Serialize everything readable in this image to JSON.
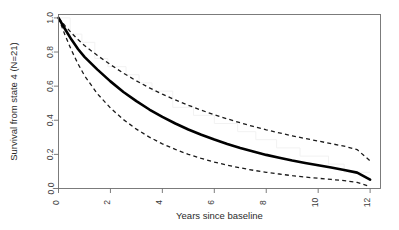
{
  "chart_data": {
    "type": "line",
    "title": "",
    "xlabel": "Years since baseline",
    "ylabel": "Survival from state 4 (N=21)",
    "xlim": [
      0,
      12.4
    ],
    "ylim": [
      0.0,
      1.02
    ],
    "xticks": [
      0,
      2,
      4,
      6,
      8,
      10,
      12
    ],
    "xticklabels": [
      "0",
      "2",
      "4",
      "6",
      "8",
      "10",
      "12"
    ],
    "yticks": [
      0.0,
      0.2,
      0.4,
      0.6,
      0.8,
      1.0
    ],
    "yticklabels": [
      "0.0",
      "0.2",
      "0.4",
      "0.6",
      "0.8",
      "1.0"
    ],
    "grid": false,
    "legend": false,
    "frame": "box",
    "x": [
      0,
      0.25,
      0.5,
      0.75,
      1,
      1.5,
      2,
      2.5,
      3,
      3.5,
      4,
      4.5,
      5,
      5.5,
      6,
      6.5,
      7,
      7.5,
      8,
      8.5,
      9,
      9.5,
      10,
      10.5,
      11,
      11.5,
      12
    ],
    "series": [
      {
        "name": "fitted-survival",
        "style": "solid",
        "color": "#000000",
        "width": 2.6,
        "values": [
          1.0,
          0.935,
          0.873,
          0.818,
          0.772,
          0.697,
          0.628,
          0.566,
          0.512,
          0.463,
          0.42,
          0.381,
          0.346,
          0.315,
          0.287,
          0.261,
          0.238,
          0.217,
          0.197,
          0.18,
          0.164,
          0.15,
          0.136,
          0.123,
          0.109,
          0.093,
          0.052
        ]
      },
      {
        "name": "upper-confidence-bound",
        "style": "dashed",
        "color": "#1a1a1a",
        "width": 1.3,
        "values": [
          1.0,
          0.955,
          0.912,
          0.873,
          0.838,
          0.78,
          0.726,
          0.676,
          0.631,
          0.59,
          0.553,
          0.519,
          0.488,
          0.459,
          0.432,
          0.408,
          0.385,
          0.364,
          0.344,
          0.326,
          0.309,
          0.293,
          0.278,
          0.263,
          0.248,
          0.228,
          0.162
        ]
      },
      {
        "name": "lower-confidence-bound",
        "style": "dashed",
        "color": "#1a1a1a",
        "width": 1.3,
        "values": [
          1.0,
          0.9,
          0.81,
          0.731,
          0.662,
          0.555,
          0.472,
          0.404,
          0.348,
          0.301,
          0.262,
          0.229,
          0.2,
          0.176,
          0.155,
          0.137,
          0.121,
          0.107,
          0.095,
          0.085,
          0.075,
          0.067,
          0.06,
          0.053,
          0.046,
          0.036,
          0.011
        ]
      }
    ],
    "step_curve": {
      "name": "kaplan-meier-estimate",
      "style": "step",
      "color": "#f2f2f2",
      "width": 1.0,
      "x": [
        0,
        0.45,
        0.45,
        0.9,
        0.9,
        1.4,
        1.4,
        1.9,
        1.9,
        2.6,
        2.6,
        3.1,
        3.1,
        3.6,
        3.6,
        4.4,
        4.4,
        5.2,
        5.2,
        6.0,
        6.0,
        6.9,
        6.9,
        7.6,
        7.6,
        8.4,
        8.4,
        9.3,
        9.3,
        10.4,
        10.4,
        11.0,
        11.0,
        12.0
      ],
      "y": [
        1.0,
        1.0,
        0.905,
        0.905,
        0.857,
        0.857,
        0.762,
        0.762,
        0.714,
        0.714,
        0.667,
        0.667,
        0.619,
        0.619,
        0.571,
        0.571,
        0.476,
        0.476,
        0.429,
        0.429,
        0.381,
        0.381,
        0.333,
        0.333,
        0.286,
        0.286,
        0.238,
        0.238,
        0.19,
        0.19,
        0.143,
        0.143,
        0.095,
        0.095
      ]
    }
  },
  "colors": {
    "background": "#ffffff",
    "axis": "#4a4a4a",
    "curve": "#000000",
    "confidence": "#1a1a1a",
    "step": "#f2f2f2",
    "text": "#2b2b2b"
  }
}
